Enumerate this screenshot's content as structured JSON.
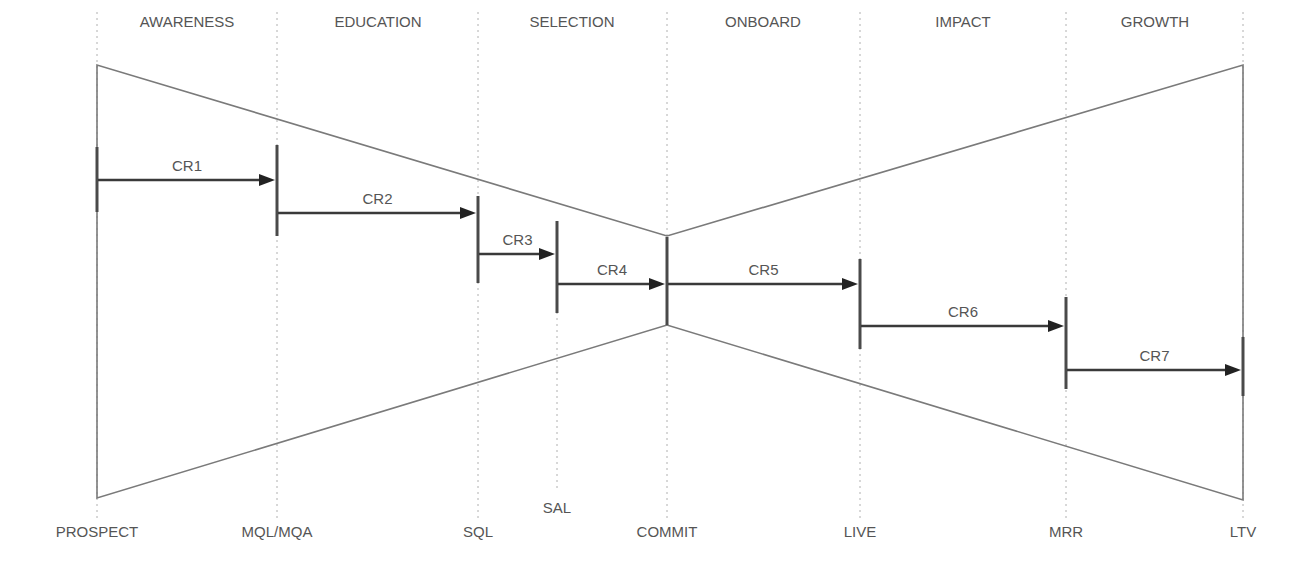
{
  "diagram": {
    "type": "bowtie-funnel",
    "colors": {
      "outline": "#7a7a7a",
      "arrow": "#3a3a3a",
      "marker": "#4a4a4a",
      "divider": "#b0b0b0",
      "text": "#555555"
    },
    "stages": [
      {
        "label": "AWARENESS",
        "x": 187
      },
      {
        "label": "EDUCATION",
        "x": 378
      },
      {
        "label": "SELECTION",
        "x": 572
      },
      {
        "label": "ONBOARD",
        "x": 763
      },
      {
        "label": "IMPACT",
        "x": 963
      },
      {
        "label": "GROWTH",
        "x": 1155
      }
    ],
    "dividers": [
      {
        "x": 97,
        "y1": 12,
        "y2": 520
      },
      {
        "x": 277,
        "y1": 12,
        "y2": 520
      },
      {
        "x": 478,
        "y1": 12,
        "y2": 520
      },
      {
        "x": 557,
        "y1": 300,
        "y2": 490
      },
      {
        "x": 667,
        "y1": 12,
        "y2": 520
      },
      {
        "x": 860,
        "y1": 12,
        "y2": 520
      },
      {
        "x": 1066,
        "y1": 12,
        "y2": 520
      },
      {
        "x": 1243,
        "y1": 12,
        "y2": 520
      }
    ],
    "milestones": [
      {
        "label": "PROSPECT",
        "x": 97,
        "y": 537
      },
      {
        "label": "MQL/MQA",
        "x": 277,
        "y": 537
      },
      {
        "label": "SQL",
        "x": 478,
        "y": 537
      },
      {
        "label": "SAL",
        "x": 557,
        "y": 513
      },
      {
        "label": "COMMIT",
        "x": 667,
        "y": 537
      },
      {
        "label": "LIVE",
        "x": 860,
        "y": 537
      },
      {
        "label": "MRR",
        "x": 1066,
        "y": 537
      },
      {
        "label": "LTV",
        "x": 1243,
        "y": 537
      }
    ],
    "outline": {
      "left_x": 97,
      "left_top": 65,
      "left_bottom": 498,
      "pinch_x": 667,
      "pinch_top": 236,
      "pinch_bottom": 325,
      "right_x": 1243,
      "right_top": 65,
      "right_bottom": 500
    },
    "markers": [
      {
        "x": 97,
        "y1": 147,
        "y2": 212
      },
      {
        "x": 277,
        "y1": 145,
        "y2": 236
      },
      {
        "x": 478,
        "y1": 196,
        "y2": 283
      },
      {
        "x": 557,
        "y1": 221,
        "y2": 313
      },
      {
        "x": 667,
        "y1": 237,
        "y2": 325
      },
      {
        "x": 860,
        "y1": 259,
        "y2": 349
      },
      {
        "x": 1066,
        "y1": 297,
        "y2": 389
      },
      {
        "x": 1243,
        "y1": 337,
        "y2": 396
      }
    ],
    "conversions": [
      {
        "label": "CR1",
        "x1": 97,
        "x2": 277,
        "y": 180
      },
      {
        "label": "CR2",
        "x1": 277,
        "x2": 478,
        "y": 213
      },
      {
        "label": "CR3",
        "x1": 478,
        "x2": 557,
        "y": 254
      },
      {
        "label": "CR4",
        "x1": 557,
        "x2": 667,
        "y": 284
      },
      {
        "label": "CR5",
        "x1": 667,
        "x2": 860,
        "y": 284
      },
      {
        "label": "CR6",
        "x1": 860,
        "x2": 1066,
        "y": 326
      },
      {
        "label": "CR7",
        "x1": 1066,
        "x2": 1243,
        "y": 370
      }
    ]
  }
}
